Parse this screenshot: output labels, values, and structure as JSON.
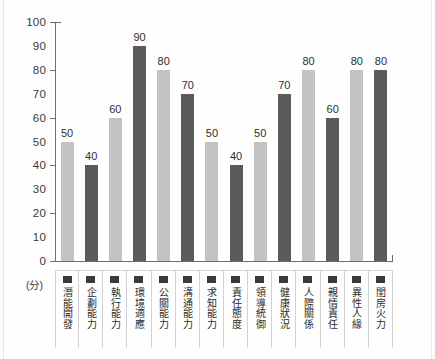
{
  "chart_data": {
    "type": "bar",
    "title": "",
    "subtitle": "",
    "xlabel": "",
    "ylabel": "(分)",
    "ylim": [
      0,
      100
    ],
    "ytick_step": 10,
    "ytick_labels": [
      "100",
      "90",
      "80",
      "70",
      "60",
      "50",
      "40",
      "30",
      "20",
      "10",
      "0"
    ],
    "major_ticks": [
      100,
      80,
      60,
      40,
      20,
      0
    ],
    "grid": false,
    "legend": "none",
    "categories": [
      "潛能開發",
      "企劃能力",
      "執行能力",
      "環境適應",
      "公關能力",
      "溝通能力",
      "求知能力",
      "責任態度",
      "領導統御",
      "健康狀況",
      "人際關係",
      "親情責任",
      "異性人緣",
      "閨房火力"
    ],
    "values": [
      50,
      40,
      60,
      90,
      80,
      70,
      50,
      40,
      50,
      70,
      80,
      60,
      80,
      80
    ],
    "bar_shades": [
      "light",
      "dark",
      "light",
      "dark",
      "light",
      "dark",
      "light",
      "dark",
      "light",
      "dark",
      "light",
      "dark",
      "light",
      "dark"
    ],
    "colors": {
      "bar_light": "#c3c3c3",
      "bar_dark": "#5b5b5b",
      "axis": "#6d6d6d",
      "text": "#2b2b2b",
      "background": "#fefefe",
      "cell_border": "#d2d2d2",
      "swatch": "#3a3a3a"
    }
  }
}
